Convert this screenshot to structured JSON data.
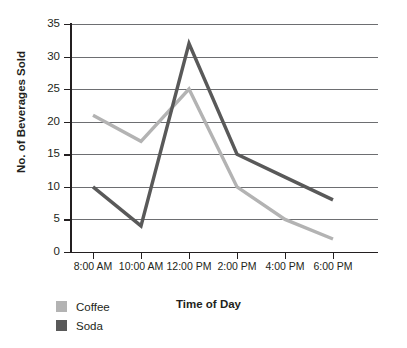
{
  "chart_data": {
    "type": "line",
    "title": "",
    "xlabel": "Time of Day",
    "ylabel": "No. of Beverages Sold",
    "categories": [
      "8:00 AM",
      "10:00 AM",
      "12:00 PM",
      "2:00 PM",
      "4:00 PM",
      "6:00 PM"
    ],
    "series": [
      {
        "name": "Coffee",
        "color": "#b3b3b3",
        "values": [
          21,
          17,
          25,
          10,
          5,
          2
        ]
      },
      {
        "name": "Soda",
        "color": "#595959",
        "values": [
          10,
          4,
          32,
          15,
          11.5,
          8
        ]
      }
    ],
    "ylim": [
      0,
      35
    ],
    "yticks": [
      0,
      5,
      10,
      15,
      20,
      25,
      30,
      35
    ],
    "ytick_labels": [
      "0",
      "5",
      "10",
      "15",
      "20",
      "25",
      "30",
      "35"
    ],
    "grid": "horizontal",
    "legend_position": "bottom-left"
  },
  "legend": {
    "items": [
      {
        "label": "Coffee"
      },
      {
        "label": "Soda"
      }
    ]
  }
}
